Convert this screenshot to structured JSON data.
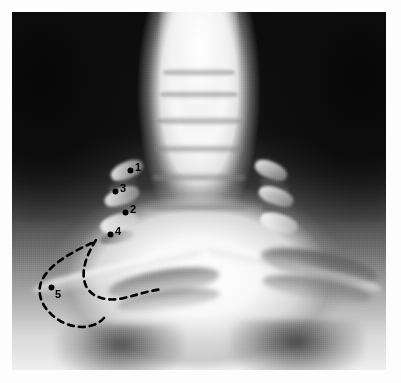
{
  "figure": {
    "kind": "radiograph",
    "modality_label": "x-ray",
    "view": "AP cervicothoracic / thoracic inlet radiograph",
    "background_color": "#ffffff",
    "plate_dark_color": "#0c0c0c",
    "plate_bright_color": "#ffffff",
    "annotation_color": "#000000",
    "plate": {
      "x": 12,
      "y": 12,
      "width": 374,
      "height": 358
    }
  },
  "annotations": {
    "marker_style": "filled-dot-with-numeral",
    "outline_style": "dashed",
    "items": [
      {
        "id": "1",
        "label": "1",
        "dot_x": 128,
        "dot_y": 168,
        "num_x": 135,
        "num_y": 162
      },
      {
        "id": "3",
        "label": "3",
        "dot_x": 113,
        "dot_y": 189,
        "num_x": 120,
        "num_y": 183
      },
      {
        "id": "2",
        "label": "2",
        "dot_x": 123,
        "dot_y": 210,
        "num_x": 130,
        "num_y": 204
      },
      {
        "id": "4",
        "label": "4",
        "dot_x": 108,
        "dot_y": 232,
        "num_x": 115,
        "num_y": 226
      },
      {
        "id": "5",
        "label": "5",
        "dot_x": 49,
        "dot_y": 285,
        "num_x": 55,
        "num_y": 289
      }
    ]
  },
  "dashed_outline": {
    "stroke": "#000000",
    "stroke_width": 2.6,
    "dash_pattern": "6 5",
    "paths": [
      "M 92 243 C 72 252 50 264 42 280 C 35 295 44 312 62 322 C 78 330 95 328 104 318",
      "M 96 240 C 86 256 80 272 86 286 C 92 298 108 302 124 298 C 140 294 152 290 163 289"
    ]
  }
}
